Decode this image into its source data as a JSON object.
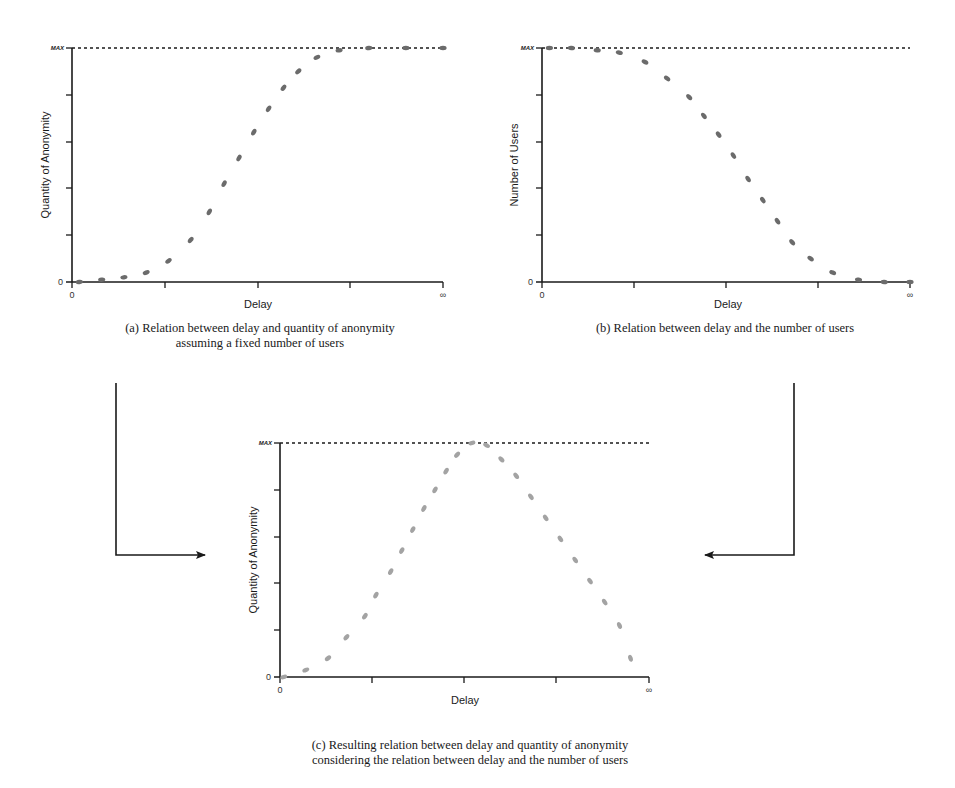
{
  "chart_data": [
    {
      "id": "a",
      "type": "scatter",
      "title": "",
      "caption_line1": "(a) Relation between delay and quantity of anonymity",
      "caption_line2": "assuming a fixed number of users",
      "xlabel": "Delay",
      "ylabel": "Quantity of Anonymity",
      "x_tick_labels": [
        "0",
        "∞"
      ],
      "y_tick_labels": [
        "0",
        "MAX"
      ],
      "ylim": [
        0,
        1
      ],
      "dot_color": "#6b6b6b",
      "description": "Sigmoid increasing from 0 to MAX as delay grows",
      "x": [
        0.02,
        0.08,
        0.14,
        0.2,
        0.26,
        0.32,
        0.37,
        0.41,
        0.45,
        0.49,
        0.53,
        0.57,
        0.61,
        0.66,
        0.72,
        0.8,
        0.9,
        1.0
      ],
      "y": [
        0.0,
        0.01,
        0.02,
        0.04,
        0.09,
        0.18,
        0.3,
        0.42,
        0.53,
        0.64,
        0.74,
        0.83,
        0.9,
        0.96,
        0.99,
        1.0,
        1.0,
        1.0
      ]
    },
    {
      "id": "b",
      "type": "scatter",
      "title": "",
      "caption_line1": "(b) Relation between delay and the number of users",
      "xlabel": "Delay",
      "ylabel": "Number of Users",
      "x_tick_labels": [
        "0",
        "∞"
      ],
      "y_tick_labels": [
        "0",
        "MAX"
      ],
      "ylim": [
        0,
        1
      ],
      "dot_color": "#6b6b6b",
      "description": "Reverse sigmoid decreasing from MAX to 0 as delay grows",
      "x": [
        0.02,
        0.08,
        0.15,
        0.21,
        0.28,
        0.34,
        0.4,
        0.44,
        0.48,
        0.52,
        0.56,
        0.6,
        0.64,
        0.68,
        0.73,
        0.79,
        0.86,
        0.93,
        1.0
      ],
      "y": [
        1.0,
        1.0,
        0.99,
        0.98,
        0.94,
        0.87,
        0.79,
        0.71,
        0.63,
        0.54,
        0.44,
        0.35,
        0.26,
        0.17,
        0.1,
        0.04,
        0.01,
        0.0,
        0.0
      ]
    },
    {
      "id": "c",
      "type": "scatter",
      "title": "",
      "caption_line1": "(c) Resulting relation between delay and quantity of anonymity",
      "caption_line2": "considering the relation between delay and the number of users",
      "xlabel": "Delay",
      "ylabel": "Quantity of Anonymity",
      "x_tick_labels": [
        "0",
        "∞"
      ],
      "y_tick_labels": [
        "0",
        "MAX"
      ],
      "ylim": [
        0,
        1
      ],
      "dot_color": "#a3a3a3",
      "description": "Rises from 0 to a peak at MAX near the middle, then falls back toward 0",
      "x": [
        0.01,
        0.07,
        0.13,
        0.18,
        0.23,
        0.26,
        0.3,
        0.33,
        0.36,
        0.39,
        0.42,
        0.45,
        0.48,
        0.52,
        0.56,
        0.6,
        0.64,
        0.68,
        0.72,
        0.76,
        0.8,
        0.84,
        0.88,
        0.92,
        0.95
      ],
      "y": [
        0.0,
        0.03,
        0.08,
        0.17,
        0.26,
        0.35,
        0.45,
        0.54,
        0.63,
        0.72,
        0.8,
        0.88,
        0.95,
        1.0,
        0.99,
        0.93,
        0.86,
        0.77,
        0.68,
        0.59,
        0.5,
        0.41,
        0.32,
        0.22,
        0.08
      ]
    }
  ],
  "labels": {
    "max": "MAX",
    "zero": "0",
    "infinity": "∞",
    "delay": "Delay",
    "qoa": "Quantity of Anonymity",
    "users": "Number of Users"
  },
  "captions": {
    "a1": "(a) Relation between delay and quantity of anonymity",
    "a2": "assuming a fixed number of users",
    "b1": "(b) Relation between delay and the number of users",
    "c1": "(c) Resulting relation between delay and quantity of anonymity",
    "c2": "considering the relation between delay and the number of users"
  },
  "colors": {
    "axis": "#1a1a1a",
    "dark_dots": "#6b6b6b",
    "light_dots": "#a3a3a3"
  }
}
